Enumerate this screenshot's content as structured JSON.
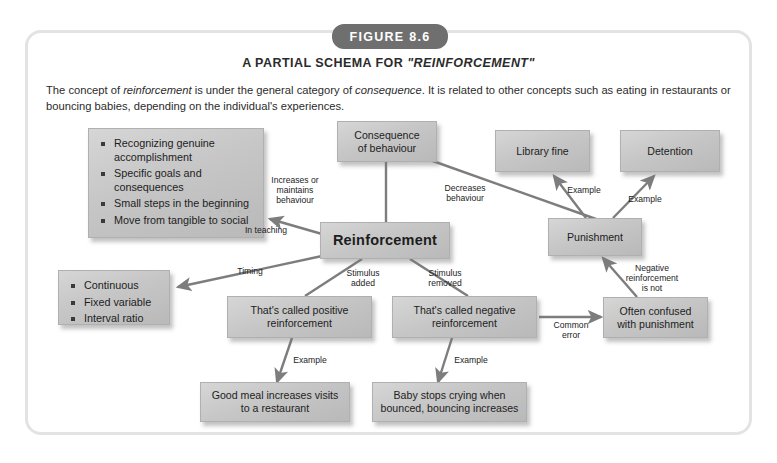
{
  "figure": {
    "badge": "FIGURE 8.6",
    "title_plain_1": "A PARTIAL SCHEMA FOR ",
    "title_italic": "\"REINFORCEMENT\"",
    "caption_1": "The concept of ",
    "caption_italic_1": "reinforcement",
    "caption_2": " is under the general category of ",
    "caption_italic_2": "consequence",
    "caption_3": ". It is related to other concepts such as eating in restaurants or bouncing babies, depending on the individual's experiences."
  },
  "diagram": {
    "type": "concept-map",
    "nodes": [
      {
        "id": "teaching-tips",
        "kind": "bulleted",
        "bullets": [
          "Recognizing genuine accomplishment",
          "Specific goals and consequences",
          "Small steps in the beginning",
          "Move from tangible to social"
        ],
        "dots": ". . . . . ."
      },
      {
        "id": "schedules",
        "kind": "bulleted",
        "bullets": [
          "Continuous",
          "Fixed variable",
          "Interval ratio"
        ]
      },
      {
        "id": "reinforcement",
        "kind": "main",
        "label": "Reinforcement"
      },
      {
        "id": "consequence",
        "kind": "box",
        "label": "Consequence\nof behaviour"
      },
      {
        "id": "library-fine",
        "kind": "box",
        "label": "Library fine"
      },
      {
        "id": "detention",
        "kind": "box",
        "label": "Detention"
      },
      {
        "id": "punishment",
        "kind": "box",
        "label": "Punishment"
      },
      {
        "id": "positive-reinforcement",
        "kind": "box",
        "label": "That's called positive\nreinforcement"
      },
      {
        "id": "negative-reinforcement",
        "kind": "box",
        "label": "That's called negative\nreinforcement"
      },
      {
        "id": "often-confused",
        "kind": "box",
        "label": "Often confused\nwith punishment"
      },
      {
        "id": "good-meal",
        "kind": "box",
        "label": "Good meal increases visits\nto a restaurant"
      },
      {
        "id": "baby-bounce",
        "kind": "box",
        "label": "Baby stops crying when\nbounced, bouncing increases"
      }
    ],
    "edge_labels": {
      "in_teaching": "In teaching",
      "timing": "Timing",
      "increases_maintains": "Increases or\nmaintains\nbehaviour",
      "decreases": "Decreases\nbehaviour",
      "example_library": "Example",
      "example_detention": "Example",
      "stimulus_added": "Stimulus\nadded",
      "stimulus_removed": "Stimulus\nremoved",
      "example_positive": "Example",
      "example_negative": "Example",
      "common_error": "Common\nerror",
      "negative_is_not": "Negative\nreinforcement\nis not"
    },
    "colors": {
      "badge": "#6f6f6f",
      "node_fill": "#c6c6c6",
      "node_border": "#b0b0b0",
      "edge": "#7d7d7d",
      "card_border": "#e3e3e3",
      "text": "#1d1d1d"
    }
  }
}
